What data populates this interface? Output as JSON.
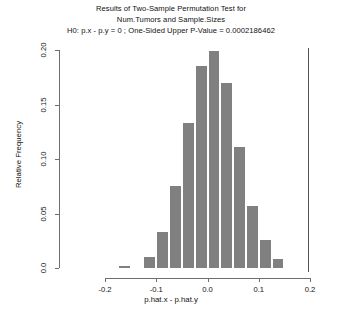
{
  "chart_data": {
    "type": "bar",
    "title": "Results of Two-Sample Permutation Test for Num.Tumors and Sample.Sizes",
    "title_lines": [
      "Results of Two-Sample Permutation Test for",
      "Num.Tumors and Sample.Sizes",
      "H0: p.x - p.y = 0 ;  One-Sided Upper P-Value = 0.0002186462"
    ],
    "subtitle": "H0: p.x - p.y = 0 ;  One-Sided Upper P-Value = 0.0002186462",
    "xlabel": "p.hat.x - p.hat.y",
    "ylabel": "Relative Frequency",
    "xlim": [
      -0.2,
      0.2
    ],
    "ylim": [
      0.0,
      0.2
    ],
    "grid": false,
    "legend": false,
    "bin_width": 0.025,
    "bar_color": "#808080",
    "bar_edge_color": "#ffffff",
    "axis_color": "#6e6e6e",
    "xticks": [
      "-0.2",
      "-0.1",
      "0.0",
      "0.1",
      "0.2"
    ],
    "xtick_values": [
      -0.2,
      -0.1,
      0.0,
      0.1,
      0.2
    ],
    "yticks": [
      "0.0",
      "0.05",
      "0.10",
      "0.15",
      "0.20"
    ],
    "ytick_values": [
      0.0,
      0.05,
      0.1,
      0.15,
      0.2
    ],
    "bin_centers": [
      -0.1625,
      -0.1375,
      -0.1125,
      -0.0875,
      -0.0625,
      -0.0375,
      -0.0125,
      0.0125,
      0.0375,
      0.0625,
      0.0875,
      0.1125,
      0.1375,
      0.1625
    ],
    "bin_left_edges": [
      -0.175,
      -0.15,
      -0.125,
      -0.1,
      -0.075,
      -0.05,
      -0.025,
      0.0,
      0.025,
      0.05,
      0.075,
      0.1,
      0.125,
      0.15
    ],
    "values": [
      0.002,
      0.0,
      0.01,
      0.033,
      0.075,
      0.133,
      0.185,
      0.199,
      0.17,
      0.111,
      0.057,
      0.026,
      0.008,
      0.0
    ],
    "reference_line": {
      "name": "observed-statistic",
      "x": 0.196,
      "color": "#555555"
    }
  }
}
